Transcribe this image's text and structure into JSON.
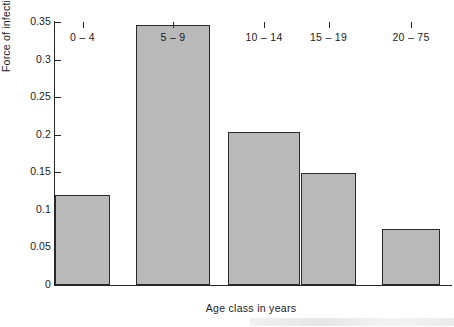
{
  "chart_data": {
    "type": "bar",
    "title": "",
    "xlabel": "Age class in years",
    "ylabel": "Force of infection·y",
    "ylabel_exponent": "−1",
    "categories": [
      "0 – 4",
      "5 – 9",
      "10 – 14",
      "15 – 19",
      "20 – 75"
    ],
    "values": [
      0.12,
      0.346,
      0.203,
      0.149,
      0.074
    ],
    "ylim": [
      0,
      0.35
    ],
    "yticks": [
      0,
      0.05,
      0.1,
      0.15,
      0.2,
      0.25,
      0.3,
      0.35
    ],
    "ytick_labels": [
      "0",
      "0.05",
      "0.1",
      "0.15",
      "0.2",
      "0.25",
      "0.3",
      "0.35"
    ],
    "grid": false,
    "legend": false,
    "bar_fill_color": "#b9b9b9",
    "bar_edge_color": "#2b2b2b",
    "axis_color": "#262626",
    "background_color": "#ffffff",
    "bar_geometry": [
      {
        "left_px": 55,
        "width_px": 55
      },
      {
        "left_px": 136,
        "width_px": 74
      },
      {
        "left_px": 228,
        "width_px": 72
      },
      {
        "left_px": 301,
        "width_px": 55
      },
      {
        "left_px": 382,
        "width_px": 58
      }
    ]
  }
}
